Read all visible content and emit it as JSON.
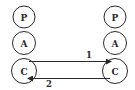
{
  "diagram": {
    "colors": {
      "stroke": "#2a2a2a",
      "background": "#ffffff"
    },
    "left_stack": {
      "nodes": [
        {
          "label": "P"
        },
        {
          "label": "A"
        },
        {
          "label": "C"
        }
      ]
    },
    "right_stack": {
      "nodes": [
        {
          "label": "P"
        },
        {
          "label": "A"
        },
        {
          "label": "C"
        }
      ]
    },
    "edges": [
      {
        "label": "1",
        "from": "left C",
        "to": "right C"
      },
      {
        "label": "2",
        "from": "right C",
        "to": "left C"
      }
    ]
  }
}
